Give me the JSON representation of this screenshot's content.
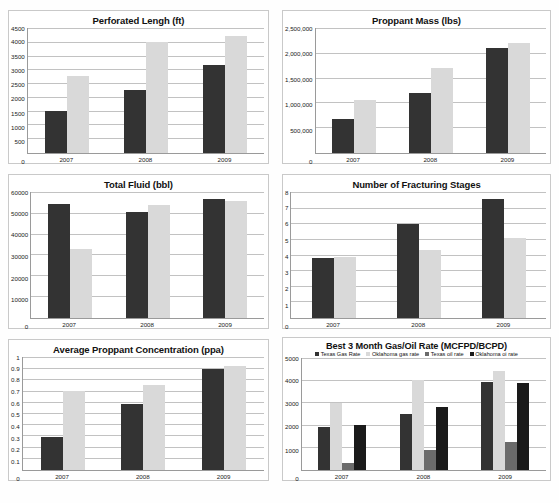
{
  "document": {
    "type": "figure-sheet",
    "panel_count": 6
  },
  "palette": {
    "dark": "#333333",
    "light": "#d9d9d9",
    "mid": "#6b6b6b",
    "black": "#1a1a1a",
    "gridline": "#c2c2c2",
    "axis": "#9a9a9a",
    "frame": "#c9c9c9",
    "background": "#ffffff"
  },
  "chart_data": [
    {
      "id": "perforated-length",
      "type": "bar",
      "title": "Perforated Lengh (ft)",
      "xlabel": "",
      "ylabel": "",
      "categories": [
        "2007",
        "2008",
        "2009"
      ],
      "yticks": [
        "4500",
        "4000",
        "3500",
        "3000",
        "2500",
        "2000",
        "1500",
        "1000",
        "500",
        "0"
      ],
      "ylim": [
        0,
        4500
      ],
      "grid": true,
      "legend": false,
      "series": [
        {
          "name": "Texas",
          "color": "#333333",
          "values": [
            1520,
            2270,
            3160
          ]
        },
        {
          "name": "Oklahoma",
          "color": "#d9d9d9",
          "values": [
            2790,
            3980,
            4230
          ]
        }
      ]
    },
    {
      "id": "proppant-mass",
      "type": "bar",
      "title": "Proppant Mass (lbs)",
      "xlabel": "",
      "ylabel": "",
      "categories": [
        "2007",
        "2008",
        "2009"
      ],
      "yticks": [
        "2,500,000",
        "2,000,000",
        "1,500,000",
        "1,000,000",
        "500,000",
        "0"
      ],
      "ylim": [
        0,
        2500000
      ],
      "grid": true,
      "legend": false,
      "series": [
        {
          "name": "Texas",
          "color": "#333333",
          "values": [
            690000,
            1210000,
            2110000
          ]
        },
        {
          "name": "Oklahoma",
          "color": "#d9d9d9",
          "values": [
            1060000,
            1710000,
            2210000
          ]
        }
      ]
    },
    {
      "id": "total-fluid",
      "type": "bar",
      "title": "Total Fluid (bbl)",
      "xlabel": "",
      "ylabel": "",
      "categories": [
        "2007",
        "2008",
        "2009"
      ],
      "yticks": [
        "60000",
        "50000",
        "40000",
        "30000",
        "20000",
        "10000",
        "0"
      ],
      "ylim": [
        0,
        60000
      ],
      "grid": true,
      "legend": false,
      "series": [
        {
          "name": "Texas",
          "color": "#333333",
          "values": [
            54500,
            50500,
            56500
          ]
        },
        {
          "name": "Oklahoma",
          "color": "#d9d9d9",
          "values": [
            33000,
            54000,
            55500
          ]
        }
      ]
    },
    {
      "id": "fracturing-stages",
      "type": "bar",
      "title": "Number of Fracturing Stages",
      "xlabel": "",
      "ylabel": "",
      "categories": [
        "2007",
        "2008",
        "2009"
      ],
      "yticks": [
        "8",
        "7",
        "6",
        "5",
        "4",
        "3",
        "2",
        "1",
        "0"
      ],
      "ylim": [
        0,
        8
      ],
      "grid": true,
      "legend": false,
      "series": [
        {
          "name": "Texas",
          "color": "#333333",
          "values": [
            3.8,
            5.95,
            7.55
          ]
        },
        {
          "name": "Oklahoma",
          "color": "#d9d9d9",
          "values": [
            3.85,
            4.35,
            5.05
          ]
        }
      ]
    },
    {
      "id": "average-proppant-concentration",
      "type": "bar",
      "title": "Average Proppant Concentration (ppa)",
      "xlabel": "",
      "ylabel": "",
      "categories": [
        "2007",
        "2008",
        "2009"
      ],
      "yticks": [
        "1",
        "0.9",
        "0.8",
        "0.7",
        "0.6",
        "0.5",
        "0.4",
        "0.3",
        "0.2",
        "0.1",
        "0"
      ],
      "ylim": [
        0,
        1
      ],
      "grid": true,
      "legend": false,
      "series": [
        {
          "name": "Texas",
          "color": "#333333",
          "values": [
            0.29,
            0.58,
            0.895
          ]
        },
        {
          "name": "Oklahoma",
          "color": "#d9d9d9",
          "values": [
            0.7,
            0.755,
            0.92
          ]
        }
      ]
    },
    {
      "id": "best-3-month-gas-oil-rate",
      "type": "bar",
      "title": "Best 3 Month Gas/Oil Rate (MCFPD/BCPD)",
      "xlabel": "",
      "ylabel": "",
      "categories": [
        "2007",
        "2008",
        "2009"
      ],
      "yticks": [
        "5000",
        "4000",
        "3000",
        "2000",
        "1000",
        "0"
      ],
      "ylim": [
        0,
        5000
      ],
      "grid": true,
      "legend": true,
      "legend_position": "top",
      "series": [
        {
          "name": "Texas Gas Rate",
          "color": "#333333",
          "values": [
            1900,
            2500,
            3930
          ]
        },
        {
          "name": "Oklahoma gas rate",
          "color": "#d9d9d9",
          "values": [
            3000,
            4020,
            4420
          ]
        },
        {
          "name": "Texas oil rate",
          "color": "#6b6b6b",
          "values": [
            320,
            900,
            1250
          ]
        },
        {
          "name": "Oklahoma oi rate",
          "color": "#1a1a1a",
          "values": [
            2000,
            2830,
            3880
          ]
        }
      ]
    }
  ]
}
